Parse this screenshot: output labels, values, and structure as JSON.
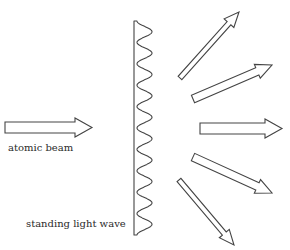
{
  "diagram": {
    "type": "atom diffraction by standing light wave",
    "labels": {
      "atomic_beam": "atomic beam",
      "standing_light_wave": "standing light wave"
    },
    "colors": {
      "stroke": "#444444",
      "text": "#2a2a2a",
      "background": "#ffffff"
    },
    "grating": {
      "left_x": 134,
      "top_y": 21,
      "bottom_y": 235,
      "wave_min_x": 137,
      "wave_max_x": 152,
      "periods": 10
    },
    "incident_arrow": {
      "tail": [
        5,
        127.5
      ],
      "tip": [
        92,
        127.5
      ],
      "shaft_width": 11,
      "head_width": 19,
      "head_length": 17
    },
    "diffracted_arrows": [
      {
        "order": "+2",
        "tail": [
          180,
          78
        ],
        "tip": [
          239,
          12
        ],
        "shaft_width": 5,
        "head_width": 13,
        "head_length": 15
      },
      {
        "order": "+1",
        "tail": [
          193,
          99
        ],
        "tip": [
          272,
          65
        ],
        "shaft_width": 8,
        "head_width": 15,
        "head_length": 16
      },
      {
        "order": "0",
        "tail": [
          200,
          128.5
        ],
        "tip": [
          282,
          128.5
        ],
        "shaft_width": 11,
        "head_width": 19,
        "head_length": 17
      },
      {
        "order": "-1",
        "tail": [
          193,
          157
        ],
        "tip": [
          272,
          193
        ],
        "shaft_width": 8,
        "head_width": 15,
        "head_length": 16
      },
      {
        "order": "-2",
        "tail": [
          179,
          180
        ],
        "tip": [
          234,
          245
        ],
        "shaft_width": 5,
        "head_width": 13,
        "head_length": 15
      }
    ]
  }
}
